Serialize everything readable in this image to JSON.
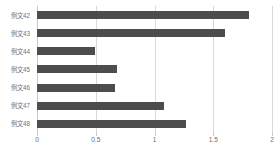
{
  "chart_data": {
    "type": "bar",
    "orientation": "horizontal",
    "title": "",
    "subtitle": "",
    "xlabel": "",
    "ylabel": "",
    "categories": [
      "例文42",
      "例文43",
      "例文44",
      "例文45",
      "例文46",
      "例文47",
      "例文48"
    ],
    "values": [
      1.8,
      1.6,
      0.49,
      0.68,
      0.66,
      1.08,
      1.27
    ],
    "xlim": [
      0,
      2
    ],
    "ylim": null,
    "xticks": [
      "0",
      "0.5",
      "1",
      "1.5",
      "2"
    ],
    "xtick_values": [
      0,
      0.5,
      1,
      1.5,
      2
    ],
    "grid": true,
    "grid_axis": "x",
    "legend": null,
    "legend_position": "none",
    "annotations": [],
    "series": [
      {
        "name": "",
        "values": [
          1.8,
          1.6,
          0.49,
          0.68,
          0.66,
          1.08,
          1.27
        ]
      }
    ]
  },
  "style": {
    "bar_color": "#4d4d4d",
    "grid_color": "#d9d9d9",
    "axis_color": "#c9c9c9",
    "label_color": "#727272",
    "tick_label_color": "#6e6e6e",
    "background": "#ffffff"
  }
}
